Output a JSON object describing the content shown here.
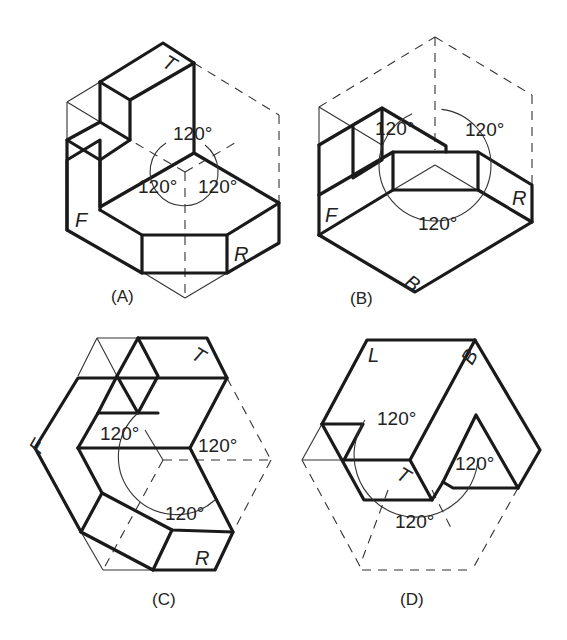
{
  "figure": {
    "panels": [
      {
        "id": "A",
        "caption": "(A)",
        "angles": [
          "120°",
          "120°",
          "120°"
        ],
        "face_labels": {
          "top": "T",
          "front": "F",
          "right": "R"
        }
      },
      {
        "id": "B",
        "caption": "(B)",
        "angles": [
          "120°",
          "120°",
          "120°"
        ],
        "face_labels": {
          "front": "F",
          "right": "R",
          "bottom": "B"
        }
      },
      {
        "id": "C",
        "caption": "(C)",
        "angles": [
          "120°",
          "120°",
          "120°"
        ],
        "face_labels": {
          "top": "T",
          "front": "F",
          "right": "R"
        }
      },
      {
        "id": "D",
        "caption": "(D)",
        "angles": [
          "120°",
          "120°",
          "120°"
        ],
        "face_labels": {
          "left": "L",
          "bottom": "B",
          "top": "T"
        }
      }
    ]
  }
}
